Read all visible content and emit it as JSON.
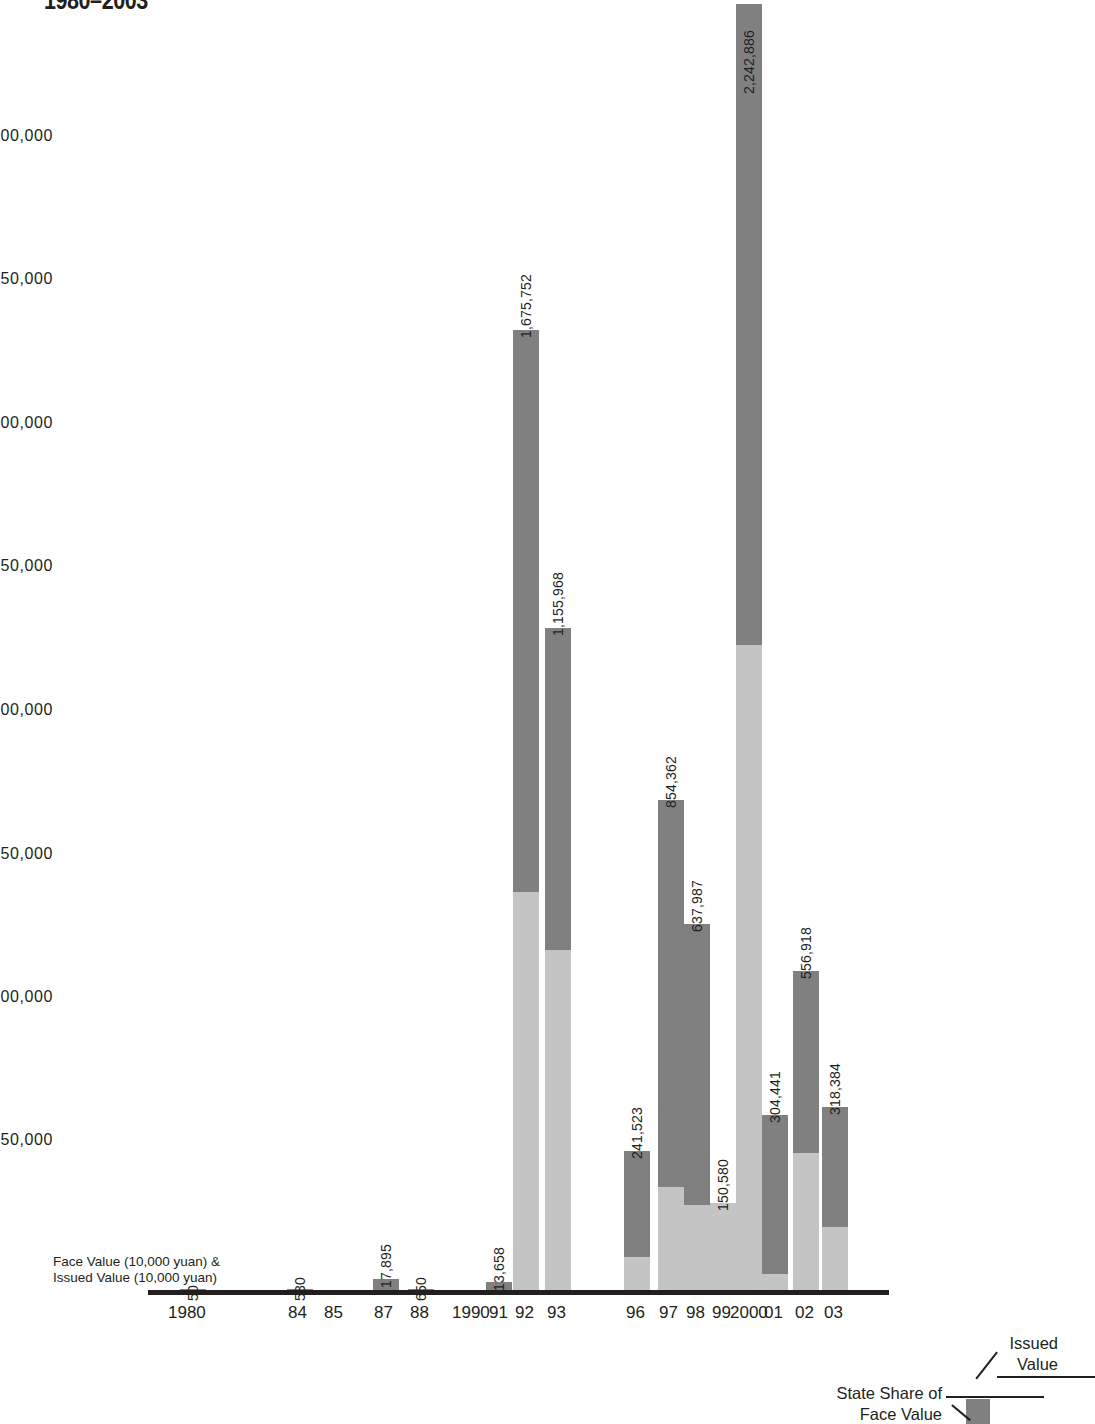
{
  "title": "1980–2003",
  "axis_title_line1": "Face Value (10,000 yuan) &",
  "axis_title_line2": "Issued Value (10,000 yuan)",
  "legend": {
    "issued_line1": "Issued",
    "issued_line2": "Value",
    "state_line1": "State Share of",
    "state_line2": "Face Value",
    "swatch_color": "#808080"
  },
  "colors": {
    "face_value": "#808080",
    "state_share": "#c4c4c4",
    "axis": "#231f20",
    "background": "#ffffff"
  },
  "chart_data": {
    "type": "bar",
    "subtype": "stacked-column",
    "title": "1980–2003",
    "xlabel": "",
    "ylabel": "Face Value (10,000 yuan) & Issued Value (10,000 yuan)",
    "ylim": [
      0,
      2250000
    ],
    "yticks": [
      250000,
      500000,
      750000,
      1000000,
      1250000,
      1500000,
      1750000,
      2000000
    ],
    "ytick_labels": [
      "250,000",
      "500,000",
      "750,000",
      "1,000,000",
      "1,250,000",
      "1,500,000",
      "1,750,000",
      "2,000,000"
    ],
    "grid": false,
    "legend_position": "bottom-right",
    "categories": [
      "1980",
      "84",
      "85",
      "87",
      "88",
      "1990",
      "91",
      "92",
      "93",
      "96",
      "97",
      "98",
      "99",
      "2000",
      "01",
      "02",
      "03"
    ],
    "tick_labels": [
      "1980",
      "84",
      "85",
      "87",
      "88",
      "1990",
      "91",
      "92",
      "93",
      "96",
      "97",
      "98",
      "99",
      "2000",
      "01",
      "02",
      "03"
    ],
    "series": [
      {
        "name": "State Share of Face Value",
        "color": "#c4c4c4",
        "values": [
          0,
          0,
          0,
          0,
          0,
          0,
          0,
          674000,
          580000,
          57000,
          180000,
          148000,
          150580,
          1125000,
          28000,
          238000,
          110000
        ]
      },
      {
        "name": "Issued Value",
        "color": "#808080",
        "values": [
          50,
          530,
          0,
          17895,
          650,
          0,
          13658,
          1001752,
          575968,
          184523,
          674362,
          489987,
          0,
          1117886,
          276441,
          318918,
          208384
        ]
      }
    ],
    "totals": [
      50,
      530,
      0,
      17895,
      650,
      0,
      13658,
      1675752,
      1155968,
      241523,
      854362,
      637987,
      150580,
      2242886,
      304441,
      556918,
      318384
    ],
    "data_labels": [
      {
        "category": "1980",
        "text": "50"
      },
      {
        "category": "84",
        "text": "530"
      },
      {
        "category": "87",
        "text": "17,895"
      },
      {
        "category": "88",
        "text": "650"
      },
      {
        "category": "91",
        "text": "13,658"
      },
      {
        "category": "92",
        "text": "1,675,752"
      },
      {
        "category": "93",
        "text": "1,155,968"
      },
      {
        "category": "96",
        "text": "241,523"
      },
      {
        "category": "97",
        "text": "854,362"
      },
      {
        "category": "98",
        "text": "637,987"
      },
      {
        "category": "99",
        "text": "150,580"
      },
      {
        "category": "2000",
        "text": "2,242,886"
      },
      {
        "category": "01",
        "text": "304,441"
      },
      {
        "category": "02",
        "text": "556,918"
      },
      {
        "category": "03",
        "text": "318,384"
      }
    ]
  },
  "bars": [
    {
      "cat": "1980",
      "label": "50",
      "x": 180,
      "w": 26,
      "total_h": 1,
      "light_h": 0,
      "lbl_y": 1285
    },
    {
      "cat": "84",
      "label": "530",
      "x": 287,
      "w": 26,
      "total_h": 1,
      "light_h": 0,
      "lbl_y": 1285
    },
    {
      "cat": "85",
      "label": "",
      "x": 322,
      "w": 26,
      "total_h": 0,
      "light_h": 0,
      "lbl_y": 1285
    },
    {
      "cat": "87",
      "label": "17,895",
      "x": 373,
      "w": 26,
      "total_h": 11,
      "light_h": 0,
      "lbl_y": 1272
    },
    {
      "cat": "88",
      "label": "650",
      "x": 408,
      "w": 26,
      "total_h": 1,
      "light_h": 0,
      "lbl_y": 1285
    },
    {
      "cat": "1990",
      "label": "",
      "x": 459,
      "w": 26,
      "total_h": 0,
      "light_h": 0,
      "lbl_y": 1285
    },
    {
      "cat": "91",
      "label": "13,658",
      "x": 486,
      "w": 26,
      "total_h": 8,
      "light_h": 0,
      "lbl_y": 1275
    },
    {
      "cat": "92",
      "label": "1,675,752",
      "x": 513,
      "w": 26,
      "total_h": 960,
      "light_h": 398,
      "lbl_y": 322
    },
    {
      "cat": "93",
      "label": "1,155,968",
      "x": 545,
      "w": 26,
      "total_h": 662,
      "light_h": 340,
      "lbl_y": 620
    },
    {
      "cat": "96",
      "label": "241,523",
      "x": 624,
      "w": 26,
      "total_h": 139,
      "light_h": 33,
      "lbl_y": 1143
    },
    {
      "cat": "97",
      "label": "854,362",
      "x": 658,
      "w": 26,
      "total_h": 490,
      "light_h": 103,
      "lbl_y": 792
    },
    {
      "cat": "98",
      "label": "637,987",
      "x": 684,
      "w": 26,
      "total_h": 366,
      "light_h": 85,
      "lbl_y": 916
    },
    {
      "cat": "99",
      "label": "150,580",
      "x": 710,
      "w": 26,
      "total_h": 87,
      "light_h": 87,
      "lbl_y": 1195
    },
    {
      "cat": "2000",
      "label": "2,242,886",
      "x": 736,
      "w": 26,
      "total_h": 1286,
      "light_h": 645,
      "lbl_y": 78
    },
    {
      "cat": "01",
      "label": "304,441",
      "x": 762,
      "w": 26,
      "total_h": 175,
      "light_h": 16,
      "lbl_y": 1107
    },
    {
      "cat": "02",
      "label": "556,918",
      "x": 793,
      "w": 26,
      "total_h": 319,
      "light_h": 137,
      "lbl_y": 963
    },
    {
      "cat": "03",
      "label": "318,384",
      "x": 822,
      "w": 26,
      "total_h": 183,
      "light_h": 63,
      "lbl_y": 1099
    }
  ],
  "y_gridlabels": [
    {
      "text": "2,000,000",
      "y": 127
    },
    {
      "text": "1,750,000",
      "y": 270
    },
    {
      "text": "1,500,000",
      "y": 414
    },
    {
      "text": "1,250,000",
      "y": 557
    },
    {
      "text": "1,000,000",
      "y": 701
    },
    {
      "text": "750,000",
      "y": 845
    },
    {
      "text": "500,000",
      "y": 988
    },
    {
      "text": "250,000",
      "y": 1131
    }
  ],
  "x_axis_labels": [
    {
      "text": "1980",
      "x": 168
    },
    {
      "text": "84",
      "x": 288
    },
    {
      "text": "85",
      "x": 324
    },
    {
      "text": "87",
      "x": 374
    },
    {
      "text": "88",
      "x": 410
    },
    {
      "text": "1990",
      "x": 452
    },
    {
      "text": "91",
      "x": 489
    },
    {
      "text": "92",
      "x": 515
    },
    {
      "text": "93",
      "x": 547
    },
    {
      "text": "96",
      "x": 626
    },
    {
      "text": "97",
      "x": 659
    },
    {
      "text": "98",
      "x": 686
    },
    {
      "text": "99",
      "x": 712
    },
    {
      "text": "2000",
      "x": 730
    },
    {
      "text": "01",
      "x": 764
    },
    {
      "text": "02",
      "x": 795
    },
    {
      "text": "03",
      "x": 824
    }
  ]
}
